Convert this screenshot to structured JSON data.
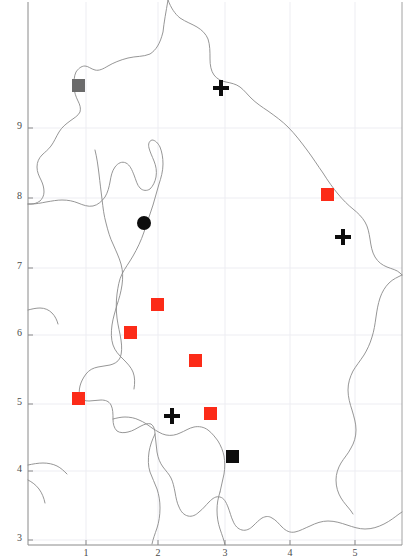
{
  "figure": {
    "width": 407,
    "height": 560,
    "background": "#ffffff",
    "frame_color": "#8a8a8a",
    "grid_color": "#ededf2",
    "coastline_color": "#8a8a8a"
  },
  "axes": {
    "x_ticks": [
      {
        "label": "1",
        "x": 86
      },
      {
        "label": "2",
        "x": 158
      },
      {
        "label": "3",
        "x": 225
      },
      {
        "label": "4",
        "x": 290
      },
      {
        "label": "5",
        "x": 355
      }
    ],
    "y_ticks": [
      {
        "label": "9",
        "y": 128
      },
      {
        "label": "8",
        "y": 198
      },
      {
        "label": "7",
        "y": 268
      },
      {
        "label": "6",
        "y": 335
      },
      {
        "label": "5",
        "y": 404
      },
      {
        "label": "4",
        "y": 471
      },
      {
        "label": "3",
        "y": 540
      }
    ],
    "xlabel": "",
    "ylabel": "",
    "grid": true,
    "frame": {
      "left": 28,
      "right": 402,
      "top": 2,
      "bottom": 545
    }
  },
  "chart_data": {
    "type": "scatter",
    "title": "",
    "xlabel": "",
    "ylabel": "",
    "grid": true,
    "legend": "none",
    "xlim": [
      0.7,
      5.7
    ],
    "ylim": [
      2.9,
      9.6
    ],
    "series": [
      {
        "name": "red-square",
        "marker": "square",
        "color": "#fc2b18",
        "points": [
          {
            "x": 4.52,
            "y": 8.06,
            "px": 327,
            "py": 194
          },
          {
            "x": 1.99,
            "y": 6.45,
            "px": 157,
            "py": 304
          },
          {
            "x": 1.6,
            "y": 6.04,
            "px": 130,
            "py": 332
          },
          {
            "x": 2.55,
            "y": 5.63,
            "px": 195,
            "py": 360
          },
          {
            "x": 0.88,
            "y": 5.09,
            "px": 78,
            "py": 398
          },
          {
            "x": 2.77,
            "y": 4.87,
            "px": 210,
            "py": 413
          }
        ]
      },
      {
        "name": "black-plus",
        "marker": "plus",
        "color": "#0d0d0d",
        "points": [
          {
            "x": 2.93,
            "y": 9.58,
            "px": 221,
            "py": 88
          },
          {
            "x": 4.75,
            "y": 7.45,
            "px": 343,
            "py": 237
          },
          {
            "x": 2.21,
            "y": 4.88,
            "px": 172,
            "py": 416
          }
        ]
      },
      {
        "name": "black-circle",
        "marker": "circle",
        "color": "#0d0d0d",
        "points": [
          {
            "x": 1.8,
            "y": 7.83,
            "px": 144,
            "py": 223
          }
        ]
      },
      {
        "name": "black-square",
        "marker": "square",
        "color": "#0d0d0d",
        "points": [
          {
            "x": 3.09,
            "y": 4.27,
            "px": 232,
            "py": 456
          }
        ]
      },
      {
        "name": "gray-square",
        "marker": "square",
        "color": "#6b6b6b",
        "points": [
          {
            "x": 0.88,
            "y": 9.62,
            "px": 78,
            "py": 85
          }
        ]
      }
    ]
  }
}
